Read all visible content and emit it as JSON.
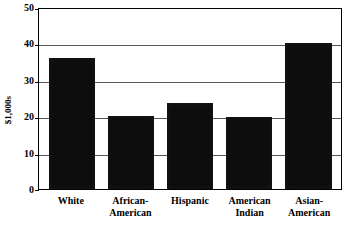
{
  "chart_data": {
    "type": "bar",
    "title": "",
    "xlabel": "",
    "ylabel": "$1,000s",
    "categories": [
      "White",
      "African-American",
      "Hispanic",
      "American Indian",
      "Asian-American"
    ],
    "category_lines": [
      [
        "White",
        ""
      ],
      [
        "African-",
        "American"
      ],
      [
        "Hispanic",
        ""
      ],
      [
        "American",
        "Indian"
      ],
      [
        "Asian-",
        "American"
      ]
    ],
    "values": [
      36,
      20,
      23.5,
      19.8,
      40
    ],
    "ylim": [
      0,
      50
    ],
    "yticks": [
      0,
      10,
      20,
      30,
      40,
      50
    ],
    "ytick_labels": [
      "0",
      "10",
      "20",
      "30",
      "40",
      "50"
    ],
    "grid": true,
    "legend": "none",
    "bar_color": "#0d0d0d",
    "background_color": "#ffffff",
    "axis_color": "#000000",
    "gridline_color": "#555555"
  }
}
